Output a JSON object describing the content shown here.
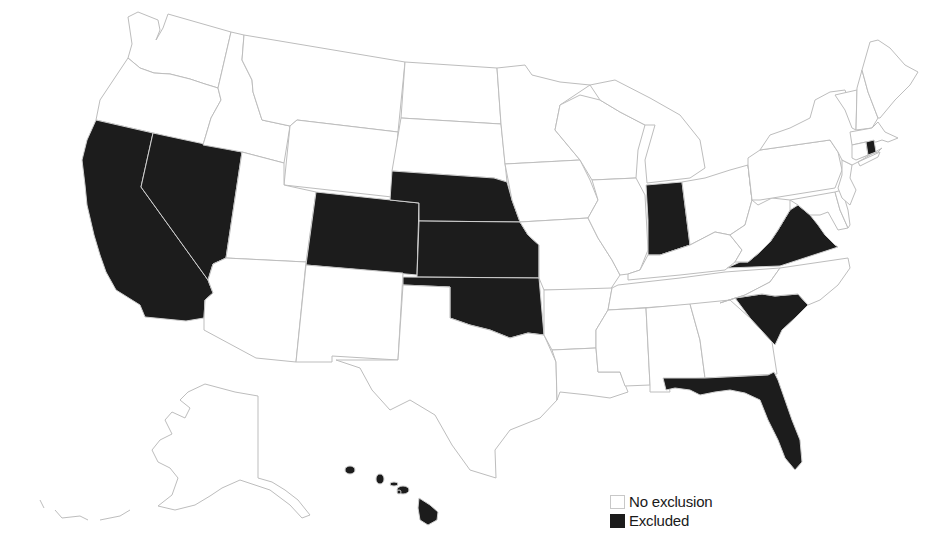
{
  "map": {
    "type": "choropleth",
    "region": "United States",
    "colors": {
      "no_exclusion": "#ffffff",
      "excluded": "#1c1c1c",
      "border": "#bdbdbd"
    },
    "excluded_states": [
      "California",
      "Nevada",
      "Colorado",
      "Nebraska",
      "Kansas",
      "Oklahoma",
      "Indiana",
      "Virginia",
      "South Carolina",
      "Florida",
      "Rhode Island",
      "Hawaii"
    ],
    "no_exclusion_states": [
      "Washington",
      "Oregon",
      "Idaho",
      "Montana",
      "Wyoming",
      "Utah",
      "Arizona",
      "New Mexico",
      "North Dakota",
      "South Dakota",
      "Texas",
      "Minnesota",
      "Iowa",
      "Missouri",
      "Arkansas",
      "Louisiana",
      "Wisconsin",
      "Illinois",
      "Michigan",
      "Ohio",
      "Kentucky",
      "Tennessee",
      "Mississippi",
      "Alabama",
      "Georgia",
      "North Carolina",
      "West Virginia",
      "Pennsylvania",
      "New York",
      "New Jersey",
      "Delaware",
      "Maryland",
      "Vermont",
      "New Hampshire",
      "Maine",
      "Massachusetts",
      "Connecticut",
      "Alaska"
    ]
  },
  "legend": {
    "items": [
      {
        "label": "No exclusion",
        "key": "none"
      },
      {
        "label": "Excluded",
        "key": "excluded"
      }
    ]
  }
}
